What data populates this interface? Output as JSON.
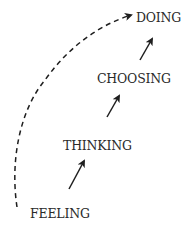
{
  "diagram": {
    "type": "progression-flow",
    "stages": [
      {
        "id": "feeling",
        "label": "FEELING"
      },
      {
        "id": "thinking",
        "label": "THINKING"
      },
      {
        "id": "choosing",
        "label": "CHOOSING"
      },
      {
        "id": "doing",
        "label": "DOING"
      }
    ],
    "edges": [
      {
        "from": "feeling",
        "to": "thinking",
        "style": "solid"
      },
      {
        "from": "thinking",
        "to": "choosing",
        "style": "solid"
      },
      {
        "from": "choosing",
        "to": "doing",
        "style": "solid"
      },
      {
        "from": "feeling",
        "to": "doing",
        "style": "dashed"
      }
    ],
    "colors": {
      "line": "#1e1e1e",
      "text": "#2a2a2a",
      "background": "#ffffff"
    }
  }
}
